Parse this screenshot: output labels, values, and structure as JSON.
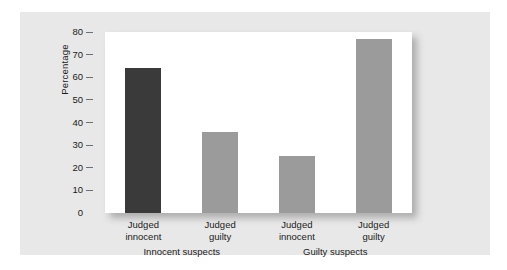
{
  "chart_data": {
    "type": "bar",
    "title": "",
    "xlabel": "",
    "ylabel": "Percentage",
    "ylim": [
      0,
      80
    ],
    "yticks": [
      0,
      10,
      20,
      30,
      40,
      50,
      60,
      70,
      80
    ],
    "grid": false,
    "legend": "none",
    "categories": [
      "Judged innocent",
      "Judged guilty",
      "Judged innocent",
      "Judged guilty"
    ],
    "category_lines": [
      {
        "line1": "Judged",
        "line2": "innocent"
      },
      {
        "line1": "Judged",
        "line2": "guilty"
      },
      {
        "line1": "Judged",
        "line2": "innocent"
      },
      {
        "line1": "Judged",
        "line2": "guilty"
      }
    ],
    "values": [
      64,
      36,
      25,
      77
    ],
    "bar_colors": [
      "#3a3a3a",
      "#9b9b9b",
      "#9b9b9b",
      "#9b9b9b"
    ],
    "groups": [
      {
        "label": "Innocent suspects",
        "categories": [
          "Judged innocent",
          "Judged guilty"
        ],
        "values": [
          64,
          36
        ]
      },
      {
        "label": "Guilty suspects",
        "categories": [
          "Judged innocent",
          "Judged guilty"
        ],
        "values": [
          25,
          77
        ]
      }
    ]
  },
  "colors": {
    "page_background": "#ffffff",
    "panel_background": "#e8e8e8",
    "plot_background": "#ffffff",
    "dark_bar": "#3a3a3a",
    "gray_bar": "#9b9b9b",
    "text": "#1a1a1a",
    "tick_mark": "#6f6f6f"
  }
}
